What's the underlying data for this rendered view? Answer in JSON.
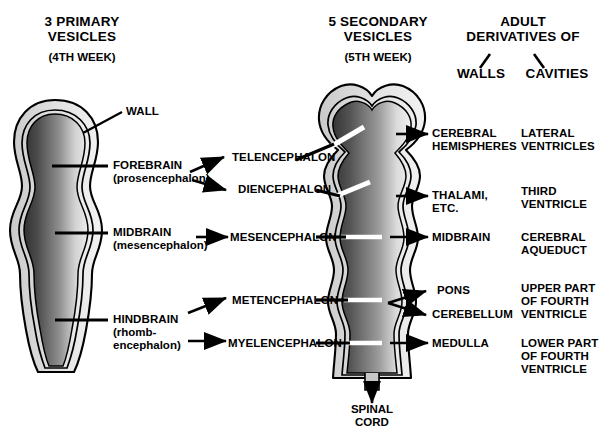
{
  "headers": {
    "primary_title": "3 PRIMARY\nVESICLES",
    "primary_sub": "(4TH WEEK)",
    "secondary_title": "5 SECONDARY\nVESICLES",
    "secondary_sub": "(5TH WEEK)",
    "adult_title": "ADULT\nDERIVATIVES OF",
    "walls": "WALLS",
    "cavities": "CAVITIES"
  },
  "annotations": {
    "wall": "WALL",
    "spinal_cord": "SPINAL\nCORD"
  },
  "primary_vesicles": [
    {
      "name": "FOREBRAIN",
      "alt": "(prosencephalon)"
    },
    {
      "name": "MIDBRAIN",
      "alt": "(mesencephalon)"
    },
    {
      "name": "HINDBRAIN",
      "alt": "(rhomb-\nencephalon)"
    }
  ],
  "secondary_vesicles": [
    {
      "name": "TELENCEPHALON"
    },
    {
      "name": "DIENCEPHALON"
    },
    {
      "name": "MESENCEPHALON"
    },
    {
      "name": "METENCEPHALON"
    },
    {
      "name": "MYELENCEPHALON"
    }
  ],
  "adult_walls": [
    {
      "name": "CEREBRAL\nHEMISPHERES"
    },
    {
      "name": "THALAMI,\nETC."
    },
    {
      "name": "MIDBRAIN"
    },
    {
      "name": "PONS"
    },
    {
      "name": "CEREBELLUM"
    },
    {
      "name": "MEDULLA"
    }
  ],
  "adult_cavities": [
    {
      "name": "LATERAL\nVENTRICLES"
    },
    {
      "name": "THIRD\nVENTRICLE"
    },
    {
      "name": "CEREBRAL\nAQUEDUCT"
    },
    {
      "name": "UPPER PART\nOF FOURTH\nVENTRICLE"
    },
    {
      "name": "LOWER PART\nOF FOURTH\nVENTRICLE"
    }
  ],
  "colors": {
    "outline": "#000000",
    "wall_band": "#d9d9d9",
    "lumen_dark": "#3a3a3a",
    "lumen_light": "#e4e4e4",
    "text": "#000000",
    "background": "#ffffff"
  },
  "icons": {
    "arrow": "arrow-right-icon",
    "leader": "leader-line-icon",
    "down_arrow": "arrow-down-icon",
    "slash_left": "slash-left-icon",
    "slash_right": "slash-right-icon"
  }
}
